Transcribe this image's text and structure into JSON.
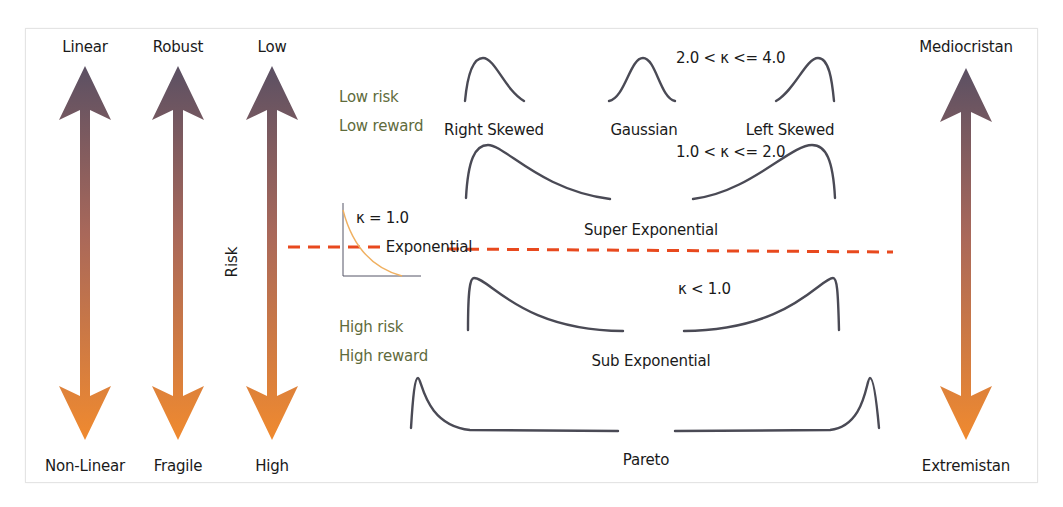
{
  "colors": {
    "arrow_top": "#5b5063",
    "arrow_bottom": "#f08a2f",
    "dash_line": "#e8491e",
    "curve": "#4a4a55",
    "mini_curve": "#f0b060",
    "mini_axes": "#555566",
    "green_text": "#5f6b3c"
  },
  "scales": [
    {
      "id": "linearity",
      "top": "Linear",
      "bottom": "Non-Linear"
    },
    {
      "id": "robustness",
      "top": "Robust",
      "bottom": "Fragile"
    },
    {
      "id": "risk",
      "top": "Low",
      "bottom": "High",
      "axis_label": "Risk"
    },
    {
      "id": "domain",
      "top": "Mediocristan",
      "bottom": "Extremistan"
    }
  ],
  "annotations": {
    "low_risk": "Low risk",
    "low_reward": "Low reward",
    "high_risk": "High risk",
    "high_reward": "High reward"
  },
  "distributions": {
    "right_skewed": "Right Skewed",
    "gaussian": "Gaussian",
    "left_skewed": "Left Skewed",
    "super_exponential": "Super Exponential",
    "exponential": "Exponential",
    "sub_exponential": "Sub Exponential",
    "pareto": "Pareto"
  },
  "kappa": {
    "gaussian_range": "2.0 < κ <= 4.0",
    "super_exp_range": "1.0 < κ <= 2.0",
    "exponential": "κ = 1.0",
    "sub_exp_range": "κ < 1.0"
  }
}
